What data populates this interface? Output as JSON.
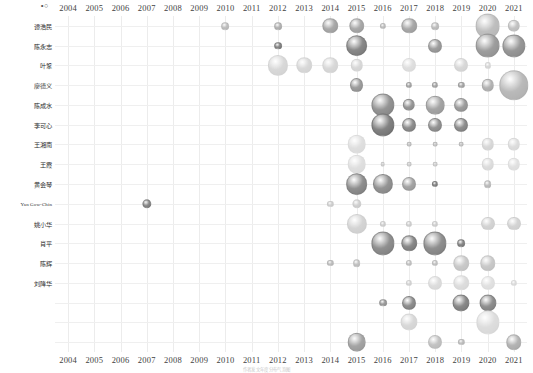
{
  "corner": {
    "glyph": "∘○"
  },
  "caption": {
    "text": "作者发文年度分布气泡图"
  },
  "axis": {
    "x_label": "",
    "y_label": "",
    "years": [
      2004,
      2005,
      2006,
      2007,
      2008,
      2009,
      2010,
      2011,
      2012,
      2013,
      2014,
      2015,
      2016,
      2017,
      2018,
      2019,
      2020,
      2021
    ]
  },
  "authors": [
    "谭浩民",
    "陈永志",
    "叶鞏",
    "廖德义",
    "陈成水",
    "李可心",
    "王湘南",
    "王霞",
    "黄会琴",
    "Yan Gow-Chin",
    "姚小华",
    "肖平",
    "陈辉",
    "刘降华"
  ],
  "chart_data": {
    "type": "scatter",
    "subtype": "bubble",
    "title": "",
    "xlabel": "",
    "ylabel": "",
    "x": [
      2004,
      2005,
      2006,
      2007,
      2008,
      2009,
      2010,
      2011,
      2012,
      2013,
      2014,
      2015,
      2016,
      2017,
      2018,
      2019,
      2020,
      2021
    ],
    "categories": [
      "谭浩民",
      "陈永志",
      "叶鞏",
      "廖德义",
      "陈成水",
      "李可心",
      "王湘南",
      "王霞",
      "黄会琴",
      "Yan Gow-Chin",
      "姚小华",
      "肖平",
      "陈辉",
      "刘降华"
    ],
    "grid": true,
    "legend": "none",
    "size_encodes": "publication count",
    "color_encodes": "publication count (darker = larger)",
    "points": [
      {
        "row": 0,
        "year": 2010,
        "size": 5,
        "shade": 0.3
      },
      {
        "row": 0,
        "year": 2012,
        "size": 5,
        "shade": 0.35
      },
      {
        "row": 0,
        "year": 2014,
        "size": 10,
        "shade": 0.4
      },
      {
        "row": 0,
        "year": 2015,
        "size": 10,
        "shade": 0.4
      },
      {
        "row": 0,
        "year": 2016,
        "size": 4,
        "shade": 0.3
      },
      {
        "row": 0,
        "year": 2017,
        "size": 10,
        "shade": 0.4
      },
      {
        "row": 0,
        "year": 2018,
        "size": 5,
        "shade": 0.3
      },
      {
        "row": 0,
        "year": 2020,
        "size": 16,
        "shade": 0.3
      },
      {
        "row": 0,
        "year": 2021,
        "size": 8,
        "shade": 0.28
      },
      {
        "row": 1,
        "year": 2012,
        "size": 5,
        "shade": 0.55
      },
      {
        "row": 1,
        "year": 2015,
        "size": 14,
        "shade": 0.55
      },
      {
        "row": 1,
        "year": 2018,
        "size": 9,
        "shade": 0.45
      },
      {
        "row": 1,
        "year": 2020,
        "size": 16,
        "shade": 0.45
      },
      {
        "row": 1,
        "year": 2021,
        "size": 15,
        "shade": 0.48
      },
      {
        "row": 2,
        "year": 2012,
        "size": 13,
        "shade": 0.18
      },
      {
        "row": 2,
        "year": 2013,
        "size": 10,
        "shade": 0.18
      },
      {
        "row": 2,
        "year": 2014,
        "size": 10,
        "shade": 0.18
      },
      {
        "row": 2,
        "year": 2015,
        "size": 8,
        "shade": 0.18
      },
      {
        "row": 2,
        "year": 2017,
        "size": 9,
        "shade": 0.15
      },
      {
        "row": 2,
        "year": 2019,
        "size": 9,
        "shade": 0.18
      },
      {
        "row": 2,
        "year": 2020,
        "size": 4,
        "shade": 0.18
      },
      {
        "row": 3,
        "year": 2015,
        "size": 9,
        "shade": 0.45
      },
      {
        "row": 3,
        "year": 2017,
        "size": 4,
        "shade": 0.4
      },
      {
        "row": 3,
        "year": 2018,
        "size": 4,
        "shade": 0.4
      },
      {
        "row": 3,
        "year": 2019,
        "size": 4,
        "shade": 0.4
      },
      {
        "row": 3,
        "year": 2020,
        "size": 8,
        "shade": 0.35
      },
      {
        "row": 3,
        "year": 2021,
        "size": 19,
        "shade": 0.32
      },
      {
        "row": 4,
        "year": 2016,
        "size": 15,
        "shade": 0.5
      },
      {
        "row": 4,
        "year": 2017,
        "size": 8,
        "shade": 0.48
      },
      {
        "row": 4,
        "year": 2018,
        "size": 12,
        "shade": 0.42
      },
      {
        "row": 4,
        "year": 2019,
        "size": 9,
        "shade": 0.45
      },
      {
        "row": 5,
        "year": 2016,
        "size": 15,
        "shade": 0.58
      },
      {
        "row": 5,
        "year": 2017,
        "size": 9,
        "shade": 0.52
      },
      {
        "row": 5,
        "year": 2018,
        "size": 9,
        "shade": 0.5
      },
      {
        "row": 5,
        "year": 2019,
        "size": 9,
        "shade": 0.52
      },
      {
        "row": 6,
        "year": 2015,
        "size": 12,
        "shade": 0.15
      },
      {
        "row": 6,
        "year": 2017,
        "size": 3,
        "shade": 0.3
      },
      {
        "row": 6,
        "year": 2018,
        "size": 3,
        "shade": 0.3
      },
      {
        "row": 6,
        "year": 2019,
        "size": 3,
        "shade": 0.3
      },
      {
        "row": 6,
        "year": 2020,
        "size": 8,
        "shade": 0.18
      },
      {
        "row": 6,
        "year": 2021,
        "size": 8,
        "shade": 0.16
      },
      {
        "row": 7,
        "year": 2015,
        "size": 12,
        "shade": 0.15
      },
      {
        "row": 7,
        "year": 2016,
        "size": 3,
        "shade": 0.25
      },
      {
        "row": 7,
        "year": 2017,
        "size": 3,
        "shade": 0.25
      },
      {
        "row": 7,
        "year": 2018,
        "size": 3,
        "shade": 0.25
      },
      {
        "row": 7,
        "year": 2020,
        "size": 8,
        "shade": 0.16
      },
      {
        "row": 7,
        "year": 2021,
        "size": 8,
        "shade": 0.14
      },
      {
        "row": 8,
        "year": 2015,
        "size": 14,
        "shade": 0.52
      },
      {
        "row": 8,
        "year": 2016,
        "size": 13,
        "shade": 0.5
      },
      {
        "row": 8,
        "year": 2017,
        "size": 9,
        "shade": 0.42
      },
      {
        "row": 8,
        "year": 2018,
        "size": 4,
        "shade": 0.55
      },
      {
        "row": 8,
        "year": 2020,
        "size": 5,
        "shade": 0.3
      },
      {
        "row": 9,
        "year": 2007,
        "size": 6,
        "shade": 0.55
      },
      {
        "row": 9,
        "year": 2014,
        "size": 4,
        "shade": 0.22
      },
      {
        "row": 9,
        "year": 2015,
        "size": 6,
        "shade": 0.22
      },
      {
        "row": 10,
        "year": 2015,
        "size": 13,
        "shade": 0.2
      },
      {
        "row": 10,
        "year": 2016,
        "size": 4,
        "shade": 0.22
      },
      {
        "row": 10,
        "year": 2017,
        "size": 4,
        "shade": 0.22
      },
      {
        "row": 10,
        "year": 2018,
        "size": 4,
        "shade": 0.22
      },
      {
        "row": 10,
        "year": 2020,
        "size": 9,
        "shade": 0.2
      },
      {
        "row": 10,
        "year": 2021,
        "size": 9,
        "shade": 0.2
      },
      {
        "row": 11,
        "year": 2016,
        "size": 15,
        "shade": 0.52
      },
      {
        "row": 11,
        "year": 2017,
        "size": 10,
        "shade": 0.55
      },
      {
        "row": 11,
        "year": 2018,
        "size": 15,
        "shade": 0.52
      },
      {
        "row": 11,
        "year": 2019,
        "size": 5,
        "shade": 0.55
      },
      {
        "row": 12,
        "year": 2014,
        "size": 4,
        "shade": 0.3
      },
      {
        "row": 12,
        "year": 2015,
        "size": 5,
        "shade": 0.28
      },
      {
        "row": 12,
        "year": 2017,
        "size": 4,
        "shade": 0.28
      },
      {
        "row": 12,
        "year": 2018,
        "size": 4,
        "shade": 0.28
      },
      {
        "row": 12,
        "year": 2019,
        "size": 10,
        "shade": 0.25
      },
      {
        "row": 12,
        "year": 2020,
        "size": 10,
        "shade": 0.25
      },
      {
        "row": 13,
        "year": 2017,
        "size": 4,
        "shade": 0.2
      },
      {
        "row": 13,
        "year": 2018,
        "size": 9,
        "shade": 0.16
      },
      {
        "row": 13,
        "year": 2019,
        "size": 10,
        "shade": 0.16
      },
      {
        "row": 13,
        "year": 2020,
        "size": 9,
        "shade": 0.14
      },
      {
        "row": 13,
        "year": 2021,
        "size": 4,
        "shade": 0.16
      },
      {
        "row": 14,
        "year": 2016,
        "size": 5,
        "shade": 0.45
      },
      {
        "row": 14,
        "year": 2017,
        "size": 9,
        "shade": 0.52
      },
      {
        "row": 14,
        "year": 2019,
        "size": 11,
        "shade": 0.55
      },
      {
        "row": 14,
        "year": 2020,
        "size": 11,
        "shade": 0.52
      },
      {
        "row": 15,
        "year": 2017,
        "size": 11,
        "shade": 0.18
      },
      {
        "row": 15,
        "year": 2020,
        "size": 15,
        "shade": 0.16
      },
      {
        "row": 16,
        "year": 2015,
        "size": 12,
        "shade": 0.42
      },
      {
        "row": 16,
        "year": 2018,
        "size": 9,
        "shade": 0.28
      },
      {
        "row": 16,
        "year": 2019,
        "size": 4,
        "shade": 0.3
      },
      {
        "row": 16,
        "year": 2021,
        "size": 10,
        "shade": 0.35
      }
    ]
  },
  "style": {
    "bubble_light": "#ffffff",
    "bubble_dark": "#5a5a5a",
    "grid_color": "#ededed",
    "text_color": "#3a3a3a",
    "background": "#ffffff"
  }
}
